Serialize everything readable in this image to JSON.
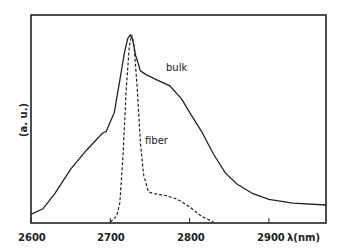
{
  "chart_data": {
    "type": "line",
    "title": "",
    "xlabel": "λ(nm)",
    "ylabel": "(a. u.)",
    "xlim": [
      2600,
      2972
    ],
    "ylim": [
      0,
      1
    ],
    "grid": false,
    "legend": "inline annotations",
    "x_ticks": [
      2600,
      2700,
      2800,
      2900
    ],
    "x_tick_labels": [
      "2600",
      "2700",
      "2800",
      "2900"
    ],
    "series": [
      {
        "name": "bulk",
        "style": "solid",
        "x": [
          2600,
          2615,
          2630,
          2650,
          2670,
          2690,
          2695,
          2705,
          2712,
          2718,
          2722,
          2725,
          2728,
          2732,
          2738,
          2745,
          2760,
          2775,
          2790,
          2800,
          2815,
          2830,
          2845,
          2860,
          2880,
          2900,
          2930,
          2972
        ],
        "y": [
          0.04,
          0.07,
          0.15,
          0.28,
          0.38,
          0.47,
          0.48,
          0.58,
          0.75,
          0.9,
          0.97,
          0.99,
          0.97,
          0.88,
          0.8,
          0.78,
          0.75,
          0.72,
          0.65,
          0.58,
          0.48,
          0.36,
          0.26,
          0.2,
          0.15,
          0.12,
          0.1,
          0.09
        ]
      },
      {
        "name": "fiber",
        "style": "dashed",
        "x": [
          2700,
          2708,
          2712,
          2716,
          2720,
          2724,
          2727,
          2730,
          2734,
          2738,
          2742,
          2748,
          2755,
          2770,
          2785,
          2800,
          2815,
          2830
        ],
        "y": [
          0.0,
          0.03,
          0.1,
          0.35,
          0.7,
          0.93,
          0.99,
          0.93,
          0.7,
          0.42,
          0.25,
          0.16,
          0.15,
          0.14,
          0.12,
          0.08,
          0.03,
          0.0
        ]
      }
    ],
    "annotations": [
      {
        "text": "bulk",
        "x": 2770,
        "y": 0.79
      },
      {
        "text": "fiber",
        "x": 2740,
        "y": 0.45
      }
    ]
  },
  "labels": {
    "ylabel": "(a. u.)",
    "xunit": "λ(nm)",
    "ticks": [
      "2600",
      "2700",
      "2800",
      "2900"
    ],
    "bulk": "bulk",
    "fiber": "fiber"
  }
}
